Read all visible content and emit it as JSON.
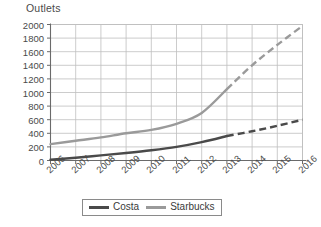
{
  "chart_data": {
    "type": "line",
    "title": "",
    "ylabel": "Outlets",
    "xlabel": "",
    "categories": [
      "2006",
      "2007",
      "2008",
      "2009",
      "2010",
      "2011",
      "2012",
      "2013",
      "2014",
      "2015",
      "2016"
    ],
    "ylim": [
      0,
      2000
    ],
    "ytick_step": 200,
    "yticks": [
      "0",
      "200",
      "400",
      "600",
      "800",
      "1000",
      "1200",
      "1400",
      "1600",
      "1800",
      "2000"
    ],
    "grid": true,
    "legend_position": "bottom",
    "forecast_note": "Values from 2013 onward are shown as dashed (projected) line segments",
    "series": [
      {
        "name": "Costa",
        "color": "#4a4a4a",
        "solid_through": "2013",
        "values": [
          10,
          40,
          75,
          110,
          150,
          200,
          270,
          360,
          430,
          510,
          600
        ]
      },
      {
        "name": "Starbucks",
        "color": "#9a9a9a",
        "solid_through": "2013",
        "values": [
          240,
          290,
          340,
          400,
          450,
          540,
          700,
          1050,
          1400,
          1700,
          1980
        ]
      }
    ]
  },
  "legend": {
    "items": [
      {
        "label": "Costa",
        "color": "#4a4a4a"
      },
      {
        "label": "Starbucks",
        "color": "#9a9a9a"
      }
    ]
  },
  "colors": {
    "costa": "#4a4a4a",
    "starbucks": "#9a9a9a",
    "grid": "#bfbfbf",
    "axis": "#6a6a6a",
    "text": "#4a4a4a"
  }
}
